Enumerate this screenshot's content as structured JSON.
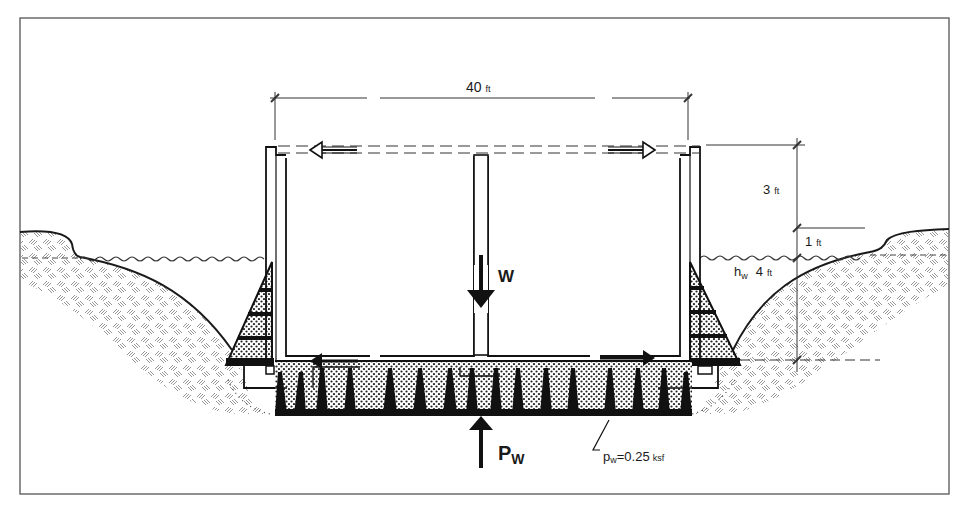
{
  "diagram": {
    "type": "cross-section",
    "labels": {
      "width_value": "40",
      "width_unit": "ft",
      "freeboard_value": "3",
      "freeboard_unit": "ft",
      "offset_value": "1",
      "offset_unit": "ft",
      "draft_symbol": "h",
      "draft_subscript": "w",
      "draft_value": "4",
      "draft_unit": "ft",
      "weight_symbol": "W",
      "uplift_symbol": "P",
      "uplift_subscript": "W",
      "pressure_symbol": "p",
      "pressure_subscript": "w",
      "pressure_value": "=0.25",
      "pressure_unit": "ksf"
    },
    "colors": {
      "ink": "#1a1a1a",
      "hatch": "#8a8a8a",
      "frame": "#555555",
      "background": "#ffffff"
    }
  }
}
